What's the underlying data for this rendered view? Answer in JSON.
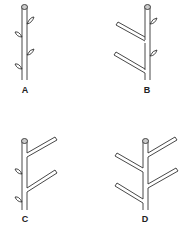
{
  "figure": {
    "panels": [
      {
        "id": "A",
        "label": "A",
        "description": "Unbranched stem with alternate lateral buds",
        "branches": 0,
        "buds": 4
      },
      {
        "id": "B",
        "label": "B",
        "description": "Stem with two left branches and two right buds",
        "branches": 2,
        "buds": 2
      },
      {
        "id": "C",
        "label": "C",
        "description": "Stem with two right branches and two left buds",
        "branches": 2,
        "buds": 2
      },
      {
        "id": "D",
        "label": "D",
        "description": "Stem with branches on both sides",
        "branches": 4,
        "buds": 0
      }
    ],
    "colors": {
      "line": "#333333",
      "background": "#ffffff"
    }
  }
}
